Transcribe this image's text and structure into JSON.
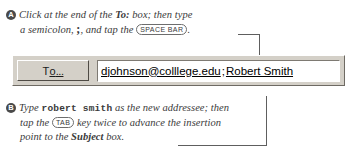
{
  "steps": [
    {
      "bullet": "A",
      "line1_pre": "Click at the end of the ",
      "line1_ui": "To:",
      "line1_post": " box; then type",
      "line2_pre": "a semicolon, ",
      "line2_char": ";",
      "line2_mid": ", and tap the ",
      "line2_key": "SPACE BAR",
      "line2_post": "."
    },
    {
      "bullet": "B",
      "line1_pre": "Type ",
      "line1_mono": "robert smith",
      "line1_post": " as the new addressee; then",
      "line2_pre": "tap the ",
      "line2_key": "TAB",
      "line2_post": " key twice to advance the insertion",
      "line3_pre": "point to the ",
      "line3_ui": "Subject",
      "line3_post": " box."
    }
  ],
  "to_row": {
    "button_label_pre": "T",
    "button_accel": "o",
    "button_dots": "...",
    "address_email": "djohnson@colllege.edu",
    "address_separator": ";",
    "address_name": "Robert Smith"
  },
  "colors": {
    "face": "#d4d0c8",
    "field": "#ffffff",
    "text": "#000000",
    "bullet": "#4a4a4a",
    "leader": "#5e5e5e"
  }
}
